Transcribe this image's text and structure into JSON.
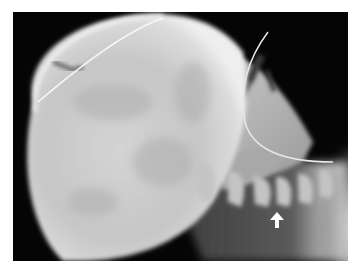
{
  "image": {
    "kind": "radiograph",
    "view": "lateral skull and cervical spine",
    "description": "Lateral X-ray of an infant skull with enlarged cranium, facial bones, nasogastric tube and cervical vertebrae; white arrow points to a cervical vertebra",
    "annotation": {
      "type": "arrow",
      "direction": "up",
      "color": "#ffffff",
      "target": "cervical vertebra"
    },
    "palette": {
      "background": "#050505",
      "bone_bright": "#e6e6e6",
      "bone_mid": "#b8b8b8",
      "soft_tissue": "#7a7a7a",
      "border": "#ffffff"
    }
  }
}
